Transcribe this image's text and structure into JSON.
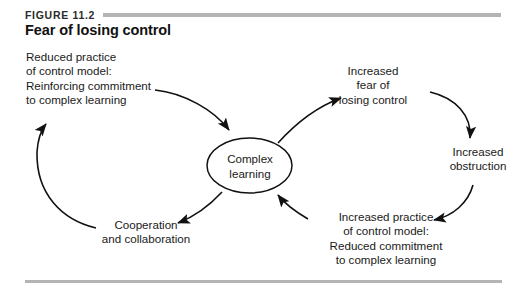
{
  "figure": {
    "number": "FIGURE 11.2",
    "title": "Fear of losing control"
  },
  "diagram": {
    "type": "causal-loop-diagram",
    "center_node": {
      "shape": "ellipse",
      "line1": "Complex",
      "line2": "learning"
    },
    "nodes": [
      {
        "id": "reduced-practice",
        "align": "left",
        "lines": [
          "Reduced practice",
          "of control model:",
          "Reinforcing commitment",
          "to complex learning"
        ]
      },
      {
        "id": "increased-fear",
        "align": "center",
        "lines": [
          "Increased",
          "fear of",
          "losing control"
        ]
      },
      {
        "id": "increased-obstruction",
        "align": "center",
        "lines": [
          "Increased",
          "obstruction"
        ]
      },
      {
        "id": "increased-practice",
        "align": "center",
        "lines": [
          "Increased practice",
          "of control model:",
          "Reduced commitment",
          "to complex learning"
        ]
      },
      {
        "id": "cooperation",
        "align": "center",
        "lines": [
          "Cooperation",
          "and collaboration"
        ]
      }
    ],
    "edges": [
      {
        "from": "reduced-practice",
        "to": "complex-learning"
      },
      {
        "from": "complex-learning",
        "to": "increased-fear"
      },
      {
        "from": "increased-fear",
        "to": "increased-obstruction"
      },
      {
        "from": "increased-obstruction",
        "to": "increased-practice"
      },
      {
        "from": "increased-practice",
        "to": "complex-learning"
      },
      {
        "from": "complex-learning",
        "to": "cooperation"
      },
      {
        "from": "cooperation",
        "to": "reduced-practice"
      }
    ]
  },
  "colors": {
    "rule": "#b4b4b4",
    "ink": "#1a1a1a",
    "background": "#ffffff"
  }
}
